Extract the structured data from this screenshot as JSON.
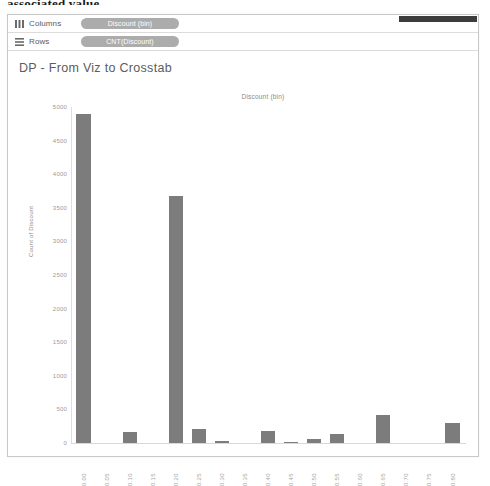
{
  "clipped_heading": "associated value.",
  "shelves": [
    {
      "icon": "columns-icon",
      "label": "Columns",
      "pill": "Discount (bin)"
    },
    {
      "icon": "rows-icon",
      "label": "Rows",
      "pill": "CNT(Discount)"
    }
  ],
  "viz": {
    "title": "DP - From Viz to Crosstab",
    "column_header": "Discount (bin)"
  },
  "colors": {
    "bar": "#7c7c7c",
    "pill": "#9a9a9a",
    "axis_text": "#9a9a9a",
    "title_text": "#5c5c5c"
  },
  "chart_data": {
    "type": "bar",
    "title": "Discount (bin)",
    "xlabel": "Discount (bin)",
    "ylabel": "Count of Discount",
    "ylim": [
      0,
      5000
    ],
    "yticks": [
      5000,
      4500,
      4000,
      3500,
      3000,
      2500,
      2000,
      1500,
      1000,
      500,
      0
    ],
    "grid": false,
    "legend": "none",
    "categories": [
      "0.00",
      "0.05",
      "0.10",
      "0.15",
      "0.20",
      "0.25",
      "0.30",
      "0.35",
      "0.40",
      "0.45",
      "0.50",
      "0.55",
      "0.60",
      "0.65",
      "0.70",
      "0.75",
      "0.80"
    ],
    "values": [
      4890,
      0,
      160,
      0,
      3680,
      215,
      30,
      0,
      175,
      10,
      65,
      130,
      0,
      420,
      0,
      0,
      300
    ]
  }
}
